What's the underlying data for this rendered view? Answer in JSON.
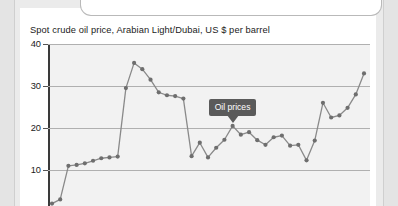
{
  "chart_data": {
    "type": "line",
    "title": "Spot crude oil price, Arabian Light/Dubai, US $ per barrel",
    "xlabel": "",
    "ylabel": "",
    "ylim": [
      0,
      40
    ],
    "yticks": [
      10,
      20,
      30,
      40
    ],
    "ytick_labels": [
      "10",
      "20",
      "30",
      "40"
    ],
    "grid": true,
    "legend_position": "none",
    "line_color": "#8a8a8a",
    "marker_color": "#6e6e6e",
    "plot_background": "#f2f2f2",
    "annotations": [
      {
        "label": "Oil prices",
        "points_to_value": 20.5,
        "background": "#5a5a5a",
        "color": "#ffffff"
      }
    ],
    "series": [
      {
        "name": "Oil prices",
        "values": [
          2.0,
          3.0,
          11.0,
          11.2,
          11.6,
          12.2,
          12.8,
          13.0,
          13.2,
          29.5,
          35.5,
          34.0,
          31.5,
          28.5,
          27.8,
          27.6,
          27.0,
          13.3,
          16.5,
          13.0,
          15.3,
          17.2,
          20.5,
          18.4,
          19.0,
          17.1,
          16.0,
          17.8,
          18.2,
          15.8,
          16.0,
          12.3,
          17.0,
          26.0,
          22.5,
          23.0,
          24.8,
          28.0,
          33.0
        ]
      }
    ]
  },
  "annotation": {
    "oil_prices_label": "Oil prices"
  },
  "yaxis": {
    "t40": "40",
    "t30": "30",
    "t20": "20",
    "t10": "10"
  }
}
